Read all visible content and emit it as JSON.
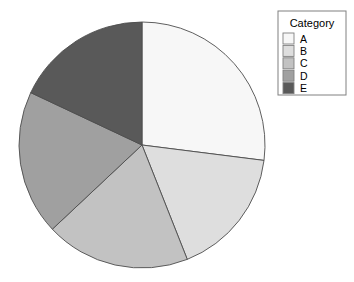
{
  "chart_data": {
    "type": "pie",
    "title": "",
    "xlabel": "",
    "ylabel": "",
    "legend_title": "Category",
    "legend_position": "right",
    "grid": false,
    "start_angle_clockwise_from_top_deg": 0,
    "categories": [
      "A",
      "B",
      "C",
      "D",
      "E"
    ],
    "values": [
      27,
      17,
      19,
      19,
      18
    ],
    "percentages": [
      27,
      17,
      19,
      19,
      18
    ],
    "slice_angles_deg": [
      97.2,
      61.2,
      68.4,
      68.4,
      64.8
    ],
    "slice_start_deg": [
      0,
      97.2,
      158.4,
      226.8,
      295.2
    ],
    "slice_end_deg": [
      97.2,
      158.4,
      226.8,
      295.2,
      360
    ],
    "colors": [
      "#f7f7f7",
      "#dedede",
      "#c2c2c2",
      "#a0a0a0",
      "#595959"
    ],
    "slice_border_color": "#4d4d4d",
    "background_color": "#ffffff"
  },
  "legend": {
    "title": "Category",
    "items": [
      {
        "label": "A",
        "color": "#f7f7f7"
      },
      {
        "label": "B",
        "color": "#dedede"
      },
      {
        "label": "C",
        "color": "#c2c2c2"
      },
      {
        "label": "D",
        "color": "#a0a0a0"
      },
      {
        "label": "E",
        "color": "#595959"
      }
    ],
    "box_border_color": "#808080",
    "box_fill_color": "#ffffff"
  },
  "geometry": {
    "center_x": 142,
    "center_y": 145,
    "radius": 123
  }
}
